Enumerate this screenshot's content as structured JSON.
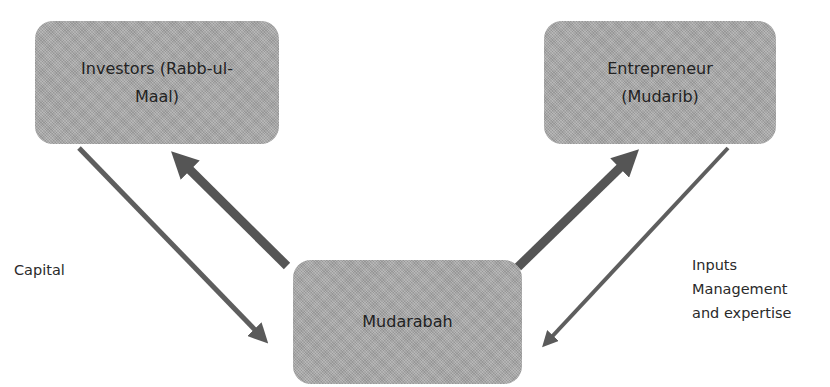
{
  "diagram": {
    "type": "flow",
    "nodes": [
      {
        "id": "investors",
        "label": "Investors (Rabb-ul-Maal)",
        "lines": [
          "Investors (Rabb-ul-",
          "Maal)"
        ]
      },
      {
        "id": "entrepreneur",
        "label": "Entrepreneur (Mudarib)",
        "lines": [
          "Entrepreneur",
          "(Mudarib)"
        ]
      },
      {
        "id": "mudarabah",
        "label": "Mudarabah",
        "lines": [
          "Mudarabah"
        ]
      }
    ],
    "edges": [
      {
        "from": "investors",
        "to": "mudarabah",
        "label": "Capital",
        "style": "thin"
      },
      {
        "from": "mudarabah",
        "to": "investors",
        "label": "",
        "style": "thick"
      },
      {
        "from": "mudarabah",
        "to": "entrepreneur",
        "label": "",
        "style": "thick"
      },
      {
        "from": "entrepreneur",
        "to": "mudarabah",
        "label": "Inputs Management and expertise",
        "style": "thin"
      }
    ],
    "labels": {
      "capital": "Capital",
      "inputs": "Inputs\nManagement\nand expertise"
    },
    "colors": {
      "node_fill": "#a8a8a8",
      "arrow": "#5a5a5a",
      "text": "#222222"
    }
  }
}
